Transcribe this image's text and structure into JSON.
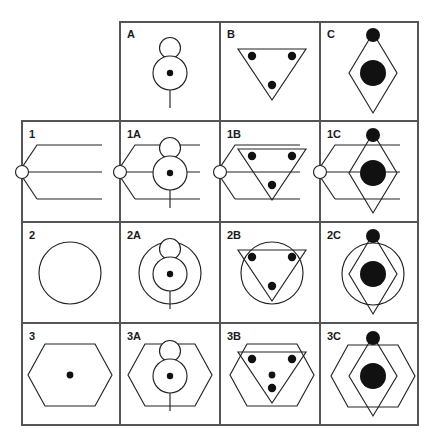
{
  "figure": {
    "type": "logic-matrix",
    "rows": 4,
    "cols": 4,
    "stroke_color": "#222222",
    "fill_color": "#111111",
    "grid_color": "#555555",
    "background": "#ffffff"
  },
  "grid": {
    "x": [
      22,
      120,
      220,
      320,
      418
    ],
    "y": [
      22,
      121,
      222,
      323,
      425
    ],
    "top_left_cell_empty": true
  },
  "column_headers": [
    {
      "label": "A",
      "shape": "vertical-line-with-two-circles-and-dot"
    },
    {
      "label": "B",
      "shape": "down-triangle-with-three-dots"
    },
    {
      "label": "C",
      "shape": "diamond-with-top-dot-and-big-disc"
    }
  ],
  "row_headers": [
    {
      "label": "1",
      "shape": "open-hexagon-left-half-with-small-circle"
    },
    {
      "label": "2",
      "shape": "circle-outline"
    },
    {
      "label": "3",
      "shape": "wide-hexagon-with-center-dot"
    }
  ],
  "cells": [
    {
      "label": "A",
      "row": 0,
      "col": 1,
      "components": [
        "A"
      ]
    },
    {
      "label": "B",
      "row": 0,
      "col": 2,
      "components": [
        "B"
      ]
    },
    {
      "label": "C",
      "row": 0,
      "col": 3,
      "components": [
        "C"
      ]
    },
    {
      "label": "1",
      "row": 1,
      "col": 0,
      "components": [
        "1"
      ]
    },
    {
      "label": "1A",
      "row": 1,
      "col": 1,
      "components": [
        "1",
        "A"
      ]
    },
    {
      "label": "1B",
      "row": 1,
      "col": 2,
      "components": [
        "1",
        "B"
      ]
    },
    {
      "label": "1C",
      "row": 1,
      "col": 3,
      "components": [
        "1",
        "C"
      ]
    },
    {
      "label": "2",
      "row": 2,
      "col": 0,
      "components": [
        "2"
      ]
    },
    {
      "label": "2A",
      "row": 2,
      "col": 1,
      "components": [
        "2",
        "A"
      ]
    },
    {
      "label": "2B",
      "row": 2,
      "col": 2,
      "components": [
        "2",
        "B"
      ]
    },
    {
      "label": "2C",
      "row": 2,
      "col": 3,
      "components": [
        "2",
        "C"
      ]
    },
    {
      "label": "3",
      "row": 3,
      "col": 0,
      "components": [
        "3"
      ]
    },
    {
      "label": "3A",
      "row": 3,
      "col": 1,
      "components": [
        "3",
        "A"
      ]
    },
    {
      "label": "3B",
      "row": 3,
      "col": 2,
      "components": [
        "3",
        "B"
      ]
    },
    {
      "label": "3C",
      "row": 3,
      "col": 3,
      "components": [
        "3",
        "C"
      ]
    }
  ],
  "labels": {
    "A": "A",
    "B": "B",
    "C": "C",
    "r1": "1",
    "r2": "2",
    "r3": "3",
    "c1A": "1A",
    "c1B": "1B",
    "c1C": "1C",
    "c2A": "2A",
    "c2B": "2B",
    "c2C": "2C",
    "c3A": "3A",
    "c3B": "3B",
    "c3C": "3C"
  }
}
